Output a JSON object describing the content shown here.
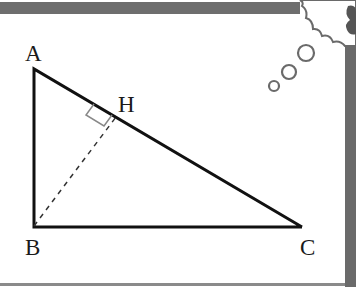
{
  "diagram": {
    "type": "geometry",
    "title": "",
    "shape": "right triangle ABC with altitude BH",
    "vertices": {
      "A": {
        "label": "A",
        "x": 34,
        "y": 69
      },
      "B": {
        "label": "B",
        "x": 34,
        "y": 227
      },
      "C": {
        "label": "C",
        "x": 302,
        "y": 227
      },
      "H": {
        "label": "H",
        "x": 116,
        "y": 117
      }
    },
    "segments": [
      {
        "from": "A",
        "to": "B",
        "style": "solid"
      },
      {
        "from": "B",
        "to": "C",
        "style": "solid"
      },
      {
        "from": "A",
        "to": "C",
        "style": "solid"
      },
      {
        "from": "B",
        "to": "H",
        "style": "dashed"
      }
    ],
    "right_angle_marker": {
      "at": "H"
    },
    "colors": {
      "line": "#111111",
      "marker": "#888888",
      "frame": "#6e6e6e",
      "bubbles": "#6a6a6a"
    }
  },
  "labels": {
    "A": "A",
    "B": "B",
    "C": "C",
    "H": "H"
  },
  "decoration": {
    "thought_bubbles": [
      {
        "cx": 274,
        "cy": 86,
        "r": 5
      },
      {
        "cx": 289,
        "cy": 72,
        "r": 7
      },
      {
        "cx": 306,
        "cy": 53,
        "r": 8
      }
    ]
  }
}
